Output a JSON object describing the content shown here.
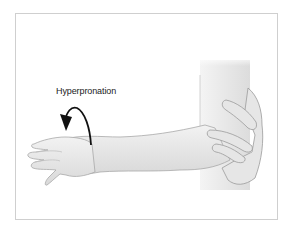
{
  "figure": {
    "annotation_label": "Hyperpronation",
    "colors": {
      "skin_fill": "#eeeeee",
      "skin_shade": "#d6d6d6",
      "outline": "#9a9a9a",
      "arrow": "#111111",
      "frame_border": "#cfcfcf",
      "background": "#ffffff"
    }
  }
}
